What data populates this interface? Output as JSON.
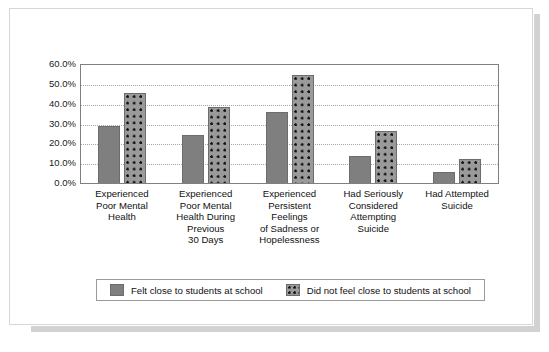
{
  "chart_data": {
    "type": "bar",
    "title": "",
    "subtitle": "",
    "xlabel": "",
    "ylabel": "",
    "ylim": [
      0,
      60
    ],
    "grid": true,
    "legend_position": "bottom",
    "ytick_labels": [
      "60.0%",
      "50.0%",
      "40.0%",
      "30.0%",
      "20.0%",
      "10.0%",
      "0.0%"
    ],
    "ytick_values": [
      60,
      50,
      40,
      30,
      20,
      10,
      0
    ],
    "categories": [
      "Experienced Poor Mental Health",
      "Experienced Poor Mental Health During Previous 30 Days",
      "Experienced Persistent Feelings of Sadness or Hopelessness",
      "Had Seriously Considered Attempting Suicide",
      "Had Attempted Suicide"
    ],
    "category_lines": [
      [
        "Experienced",
        "Poor Mental",
        "Health"
      ],
      [
        "Experienced",
        "Poor Mental",
        "Health During",
        "Previous",
        "30 Days"
      ],
      [
        "Experienced",
        "Persistent",
        "Feelings",
        "of Sadness or",
        "Hopelessness"
      ],
      [
        "Had Seriously",
        "Considered",
        "Attempting",
        "Suicide"
      ],
      [
        "Had Attempted",
        "Suicide"
      ]
    ],
    "series": [
      {
        "name": "Felt close to students at school",
        "pattern": "solid-gray",
        "color": "#7f7f7f",
        "values": [
          28.5,
          24.0,
          35.8,
          13.5,
          5.5
        ]
      },
      {
        "name": "Did not feel close to students at school",
        "pattern": "dotted-gray",
        "color": "#9a9a9a",
        "values": [
          45.5,
          38.5,
          54.5,
          26.0,
          12.0
        ]
      }
    ]
  },
  "legend": {
    "items": [
      {
        "label": "Felt close to students at school"
      },
      {
        "label": "Did not feel close to students at school"
      }
    ]
  },
  "colors": {
    "series_solid": "#7f7f7f",
    "series_dotted": "#9a9a9a",
    "bar_outline": "#6d6d6d",
    "grid": "#a6a6a6",
    "frame": "#808080",
    "card_border": "#d7d7d7",
    "shadow": "#d2d2d2",
    "text": "#111111",
    "page_background": "#ffffff"
  }
}
